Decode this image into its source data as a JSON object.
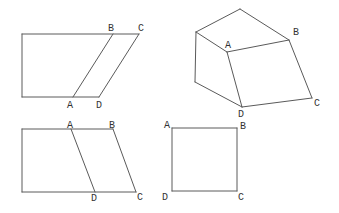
{
  "canvas": {
    "width": 339,
    "height": 213,
    "background": "#ffffff",
    "stroke_color": "#5a5a5a",
    "stroke_width": 1,
    "label_color": "#333333",
    "label_font_size": 10
  },
  "figures": [
    {
      "name": "trapezoid-with-parallelogram-left-leaning",
      "kind": "2d-outline",
      "lines": [
        {
          "x1": 22,
          "y1": 34,
          "x2": 139,
          "y2": 34
        },
        {
          "x1": 22,
          "y1": 34,
          "x2": 22,
          "y2": 97
        },
        {
          "x1": 22,
          "y1": 97,
          "x2": 99,
          "y2": 97
        },
        {
          "x1": 139,
          "y1": 34,
          "x2": 99,
          "y2": 97
        },
        {
          "x1": 113,
          "y1": 34,
          "x2": 73,
          "y2": 97
        }
      ],
      "labels": [
        {
          "text": "A",
          "x": 70,
          "y": 104
        },
        {
          "text": "B",
          "x": 111,
          "y": 27
        },
        {
          "text": "C",
          "x": 141,
          "y": 27
        },
        {
          "text": "D",
          "x": 99,
          "y": 104
        }
      ]
    },
    {
      "name": "parallelepiped-box",
      "kind": "3d-solid",
      "lines": [
        {
          "x1": 196,
          "y1": 32,
          "x2": 240,
          "y2": 9
        },
        {
          "x1": 240,
          "y1": 9,
          "x2": 289,
          "y2": 40
        },
        {
          "x1": 196,
          "y1": 32,
          "x2": 227,
          "y2": 52
        },
        {
          "x1": 227,
          "y1": 52,
          "x2": 289,
          "y2": 40
        },
        {
          "x1": 196,
          "y1": 32,
          "x2": 195,
          "y2": 82
        },
        {
          "x1": 195,
          "y1": 82,
          "x2": 242,
          "y2": 107
        },
        {
          "x1": 227,
          "y1": 52,
          "x2": 242,
          "y2": 107
        },
        {
          "x1": 242,
          "y1": 107,
          "x2": 312,
          "y2": 98
        },
        {
          "x1": 289,
          "y1": 40,
          "x2": 312,
          "y2": 98
        }
      ],
      "labels": [
        {
          "text": "A",
          "x": 228,
          "y": 44
        },
        {
          "text": "B",
          "x": 296,
          "y": 31
        },
        {
          "text": "C",
          "x": 317,
          "y": 102
        },
        {
          "text": "D",
          "x": 241,
          "y": 113
        }
      ]
    },
    {
      "name": "trapezoid-with-parallelogram-right-leaning",
      "kind": "2d-outline",
      "lines": [
        {
          "x1": 22,
          "y1": 129,
          "x2": 113,
          "y2": 129
        },
        {
          "x1": 22,
          "y1": 129,
          "x2": 22,
          "y2": 192
        },
        {
          "x1": 22,
          "y1": 192,
          "x2": 136,
          "y2": 192
        },
        {
          "x1": 113,
          "y1": 129,
          "x2": 136,
          "y2": 192
        },
        {
          "x1": 71,
          "y1": 129,
          "x2": 95,
          "y2": 192
        }
      ],
      "labels": [
        {
          "text": "A",
          "x": 70,
          "y": 124
        },
        {
          "text": "B",
          "x": 112,
          "y": 124
        },
        {
          "text": "C",
          "x": 140,
          "y": 196
        },
        {
          "text": "D",
          "x": 94,
          "y": 197
        }
      ]
    },
    {
      "name": "square",
      "kind": "2d-outline",
      "lines": [
        {
          "x1": 172,
          "y1": 128,
          "x2": 237,
          "y2": 128
        },
        {
          "x1": 237,
          "y1": 128,
          "x2": 237,
          "y2": 191
        },
        {
          "x1": 237,
          "y1": 191,
          "x2": 172,
          "y2": 191
        },
        {
          "x1": 172,
          "y1": 191,
          "x2": 172,
          "y2": 128
        }
      ],
      "labels": [
        {
          "text": "A",
          "x": 167,
          "y": 124
        },
        {
          "text": "B",
          "x": 243,
          "y": 125
        },
        {
          "text": "C",
          "x": 241,
          "y": 196
        },
        {
          "text": "D",
          "x": 165,
          "y": 196
        }
      ]
    }
  ]
}
